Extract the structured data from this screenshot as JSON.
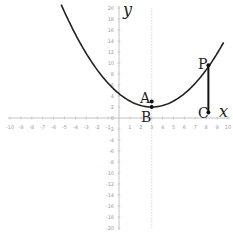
{
  "chart_data": {
    "type": "line",
    "title": "",
    "xlabel": "x",
    "ylabel": "y",
    "xlim": [
      -10,
      10
    ],
    "ylim": [
      -20,
      20
    ],
    "grid": false,
    "x_ticks": [
      -10,
      -9,
      -8,
      -7,
      -6,
      -5,
      -4,
      -3,
      -2,
      -1,
      1,
      2,
      3,
      4,
      5,
      6,
      7,
      8,
      9,
      10
    ],
    "y_ticks": [
      -20,
      -18,
      -16,
      -14,
      -12,
      -10,
      -8,
      -6,
      -4,
      -2,
      2,
      4,
      6,
      8,
      10,
      12,
      14,
      16,
      18,
      20
    ],
    "series": [
      {
        "name": "parabola",
        "equation_estimate": "y = 0.27(x-3)^2 + 2",
        "vertex": [
          3,
          2
        ],
        "x_range": [
          -5.3,
          9.6
        ],
        "color": "#222222"
      }
    ],
    "points": [
      {
        "label": "A",
        "x": 3,
        "y": 3
      },
      {
        "label": "B",
        "x": 3,
        "y": 2
      },
      {
        "label": "P",
        "x": 8.2,
        "y": 9.6
      },
      {
        "label": "C",
        "x": 8.2,
        "y": 1
      }
    ],
    "segments": [
      {
        "from": "P",
        "to": "C"
      }
    ],
    "annotations": [
      {
        "type": "dotted-vertical-line",
        "x": 3
      }
    ]
  },
  "labels": {
    "x_axis": "x",
    "y_axis": "y",
    "origin": "0",
    "A": "A",
    "B": "B",
    "P": "P",
    "C": "C"
  },
  "colors": {
    "curve": "#222222",
    "axis": "#b5b5b5",
    "tick_text": "#9a9a9a",
    "points": "#111111"
  }
}
